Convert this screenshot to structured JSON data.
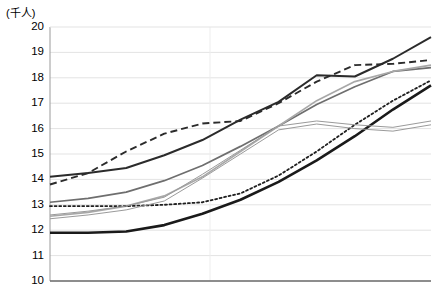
{
  "chart_data": {
    "type": "line",
    "title": "",
    "subtitle": "",
    "unit_label": "(千人)",
    "ylabel": "",
    "xlabel": "",
    "ylim": [
      10,
      20
    ],
    "ytick_labels": [
      "20",
      "19",
      "18",
      "17",
      "16",
      "15",
      "14",
      "13",
      "12",
      "11",
      "10"
    ],
    "ytick_values": [
      20,
      19,
      18,
      17,
      16,
      15,
      14,
      13,
      12,
      11,
      10
    ],
    "xlim": [
      0,
      10
    ],
    "x": [
      0,
      1,
      2,
      3,
      4,
      5,
      6,
      7,
      8,
      9,
      10
    ],
    "xtick_labels": [],
    "grid": {
      "horizontal": true,
      "vertical": true,
      "horizontal_color": "#e3e3e3",
      "vertical_color": "#ededed",
      "vertical_positions": [
        4.2
      ]
    },
    "legend": {
      "visible": false,
      "position": "none",
      "entries": []
    },
    "annotations": [],
    "series": [
      {
        "name": "series-dark-solid",
        "style": "solid",
        "color": "#2b2b2b",
        "width": 2.0,
        "values": [
          14.1,
          14.25,
          14.45,
          14.95,
          15.55,
          16.35,
          17.05,
          18.1,
          18.05,
          18.75,
          19.6
        ]
      },
      {
        "name": "series-dashed",
        "style": "dashed",
        "color": "#2b2b2b",
        "width": 1.9,
        "values": [
          13.8,
          14.25,
          15.1,
          15.8,
          16.2,
          16.3,
          17.0,
          17.85,
          18.5,
          18.55,
          18.7
        ]
      },
      {
        "name": "series-gray-solid",
        "style": "solid",
        "color": "#6e6e6e",
        "width": 1.7,
        "values": [
          13.1,
          13.25,
          13.5,
          13.95,
          14.55,
          15.3,
          16.1,
          16.95,
          17.65,
          18.25,
          18.4
        ]
      },
      {
        "name": "series-light-gray-solid",
        "style": "solid",
        "color": "#a8a8a8",
        "width": 1.7,
        "values": [
          12.55,
          12.7,
          12.95,
          13.35,
          14.1,
          15.1,
          16.1,
          17.1,
          17.85,
          18.25,
          18.5
        ]
      },
      {
        "name": "series-dotted",
        "style": "dotted",
        "color": "#1f1f1f",
        "width": 1.8,
        "values": [
          12.95,
          12.95,
          12.95,
          13.0,
          13.1,
          13.45,
          14.15,
          15.1,
          16.15,
          17.1,
          17.9
        ]
      },
      {
        "name": "series-bold-black",
        "style": "solid",
        "color": "#1a1a1a",
        "width": 2.6,
        "values": [
          11.9,
          11.9,
          11.95,
          12.2,
          12.65,
          13.2,
          13.9,
          14.75,
          15.7,
          16.75,
          17.7
        ]
      },
      {
        "name": "series-thin-outline-upper",
        "style": "solid",
        "color": "#9a9a9a",
        "width": 1.0,
        "values": [
          12.6,
          12.75,
          12.95,
          13.3,
          14.2,
          15.15,
          16.1,
          16.3,
          16.15,
          16.05,
          16.3
        ]
      },
      {
        "name": "series-thin-outline-lower",
        "style": "solid",
        "color": "#9a9a9a",
        "width": 1.0,
        "values": [
          12.45,
          12.6,
          12.8,
          13.15,
          14.05,
          15.0,
          15.95,
          16.18,
          16.0,
          15.9,
          16.15
        ]
      }
    ]
  },
  "axes": {
    "left_border_color": "#9a9a9a",
    "bottom_border_color": "#6b6b6b"
  }
}
